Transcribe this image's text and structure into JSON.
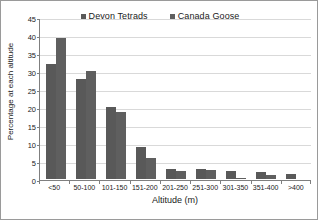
{
  "chart_data": {
    "type": "bar",
    "title": "",
    "xlabel": "Altitude (m)",
    "ylabel": "Percentage at each altitude",
    "categories": [
      "<50",
      "50-100",
      "101-150",
      "151-200",
      "201-250",
      "251-300",
      "301-350",
      "351-400",
      ">400"
    ],
    "series": [
      {
        "name": "Devon Tetrads",
        "color": "#595959",
        "values": [
          32.0,
          27.8,
          19.9,
          9.0,
          2.7,
          2.7,
          2.3,
          1.9,
          1.5
        ]
      },
      {
        "name": "Canada Goose",
        "color": "#5f5f5f",
        "values": [
          39.1,
          30.0,
          18.7,
          5.9,
          2.2,
          2.6,
          0.4,
          1.0,
          0.0
        ]
      }
    ],
    "ylim": [
      0,
      45
    ],
    "yticks": [
      0,
      5,
      10,
      15,
      20,
      25,
      30,
      35,
      40,
      45
    ],
    "ytick_labels": [
      "0",
      "5",
      "10",
      "15",
      "20",
      "25",
      "30",
      "35",
      "40",
      "45"
    ],
    "grid": true,
    "legend_position": "top-center",
    "colors": {
      "background": "#ffffff",
      "gridline": "#d9d9d9",
      "axis": "#7f7f7f",
      "border": "#9a9a9a",
      "text": "#1a1a1a"
    }
  }
}
